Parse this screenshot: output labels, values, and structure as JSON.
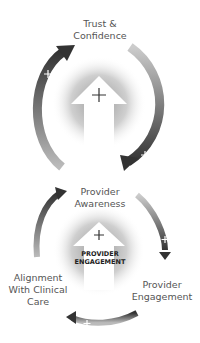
{
  "top_cycle": {
    "node_top": {
      "line1": "Trust &",
      "line2": "Confidence"
    },
    "node_bottom": {
      "line1": "Provider",
      "line2": "Awareness"
    }
  },
  "bottom_cycle": {
    "center_label": {
      "line1": "PROVIDER",
      "line2": "ENGAGEMENT"
    },
    "node_right": {
      "line1": "Provider",
      "line2": "Engagement"
    },
    "node_left": {
      "line1": "Alignment",
      "line2": "With Clinical",
      "line3": "Care"
    }
  },
  "symbols": {
    "plus": "+"
  },
  "colors": {
    "arrow_dark": "#333333",
    "arrow_light": "#a8a8a8",
    "glow": "#bdbdbd",
    "text": "#555555"
  }
}
